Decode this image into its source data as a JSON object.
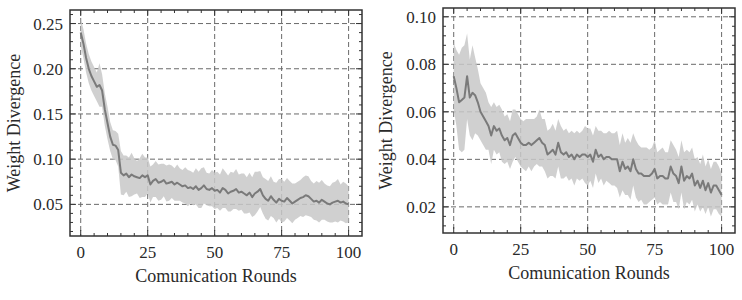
{
  "figure": {
    "background": "#ffffff",
    "line_color": "#7a7a7a",
    "band_color": "#c8c8c8",
    "grid_color": "#6a6a6a",
    "frame_color": "#333333"
  },
  "chart_data": [
    {
      "type": "line",
      "title": "",
      "xlabel": "Comunication Rounds",
      "ylabel": "Weight Divergence",
      "xlim": [
        -4,
        105
      ],
      "ylim": [
        0.015,
        0.265
      ],
      "xticks": [
        0,
        25,
        50,
        75,
        100
      ],
      "xtick_labels": [
        "0",
        "25",
        "50",
        "75",
        "100"
      ],
      "yticks": [
        0.05,
        0.1,
        0.15,
        0.2,
        0.25
      ],
      "ytick_labels": [
        "0.05",
        "0.10",
        "0.15",
        "0.20",
        "0.25"
      ],
      "grid": true,
      "legend": null,
      "series": [
        {
          "name": "mean",
          "shaded_band": "std",
          "x": [
            0,
            1,
            2,
            3,
            4,
            5,
            6,
            7,
            8,
            9,
            10,
            11,
            12,
            13,
            14,
            15,
            16,
            17,
            18,
            19,
            20,
            21,
            22,
            23,
            24,
            25,
            26,
            27,
            28,
            29,
            30,
            31,
            32,
            33,
            34,
            35,
            36,
            37,
            38,
            39,
            40,
            41,
            42,
            43,
            44,
            45,
            46,
            47,
            48,
            49,
            50,
            51,
            52,
            53,
            54,
            55,
            56,
            57,
            58,
            59,
            60,
            61,
            62,
            63,
            64,
            65,
            66,
            67,
            68,
            69,
            70,
            71,
            72,
            73,
            74,
            75,
            76,
            77,
            78,
            79,
            80,
            81,
            82,
            83,
            84,
            85,
            86,
            87,
            88,
            89,
            90,
            91,
            92,
            93,
            94,
            95,
            96,
            97,
            98,
            99,
            100
          ],
          "values": [
            0.24,
            0.228,
            0.212,
            0.2,
            0.192,
            0.186,
            0.18,
            0.182,
            0.176,
            0.155,
            0.14,
            0.125,
            0.116,
            0.115,
            0.11,
            0.085,
            0.082,
            0.084,
            0.08,
            0.083,
            0.081,
            0.08,
            0.079,
            0.082,
            0.08,
            0.082,
            0.072,
            0.076,
            0.078,
            0.074,
            0.075,
            0.077,
            0.073,
            0.074,
            0.075,
            0.072,
            0.074,
            0.072,
            0.07,
            0.071,
            0.068,
            0.069,
            0.067,
            0.07,
            0.066,
            0.068,
            0.071,
            0.067,
            0.066,
            0.068,
            0.065,
            0.066,
            0.063,
            0.068,
            0.066,
            0.062,
            0.064,
            0.065,
            0.067,
            0.063,
            0.064,
            0.062,
            0.06,
            0.063,
            0.058,
            0.062,
            0.064,
            0.067,
            0.06,
            0.056,
            0.054,
            0.059,
            0.055,
            0.052,
            0.056,
            0.054,
            0.053,
            0.057,
            0.054,
            0.051,
            0.053,
            0.055,
            0.057,
            0.058,
            0.06,
            0.059,
            0.056,
            0.053,
            0.054,
            0.052,
            0.055,
            0.053,
            0.051,
            0.05,
            0.052,
            0.053,
            0.054,
            0.052,
            0.053,
            0.051,
            0.05
          ],
          "band_halfwidth": [
            0.015,
            0.016,
            0.016,
            0.016,
            0.016,
            0.016,
            0.016,
            0.024,
            0.018,
            0.018,
            0.018,
            0.016,
            0.016,
            0.016,
            0.018,
            0.024,
            0.022,
            0.02,
            0.022,
            0.024,
            0.02,
            0.018,
            0.022,
            0.024,
            0.022,
            0.02,
            0.02,
            0.018,
            0.02,
            0.02,
            0.02,
            0.018,
            0.02,
            0.02,
            0.018,
            0.018,
            0.02,
            0.018,
            0.018,
            0.02,
            0.02,
            0.018,
            0.018,
            0.02,
            0.02,
            0.022,
            0.02,
            0.018,
            0.018,
            0.02,
            0.02,
            0.02,
            0.02,
            0.022,
            0.02,
            0.02,
            0.022,
            0.02,
            0.022,
            0.02,
            0.02,
            0.022,
            0.02,
            0.022,
            0.022,
            0.024,
            0.022,
            0.02,
            0.02,
            0.022,
            0.022,
            0.022,
            0.02,
            0.022,
            0.022,
            0.024,
            0.022,
            0.022,
            0.022,
            0.022,
            0.02,
            0.02,
            0.02,
            0.022,
            0.022,
            0.022,
            0.02,
            0.02,
            0.022,
            0.022,
            0.022,
            0.02,
            0.02,
            0.02,
            0.022,
            0.022,
            0.024,
            0.02,
            0.022,
            0.022,
            0.02
          ]
        }
      ]
    },
    {
      "type": "line",
      "title": "",
      "xlabel": "Comunication Rounds",
      "ylabel": "Weight Divergence",
      "xlim": [
        -4,
        105
      ],
      "ylim": [
        0.009,
        0.1037
      ],
      "xticks": [
        0,
        25,
        50,
        75,
        100
      ],
      "xtick_labels": [
        "0",
        "25",
        "50",
        "75",
        "100"
      ],
      "yticks": [
        0.02,
        0.04,
        0.06,
        0.08,
        0.1
      ],
      "ytick_labels": [
        "0.02",
        "0.04",
        "0.06",
        "0.08",
        "0.10"
      ],
      "grid": true,
      "legend": null,
      "series": [
        {
          "name": "mean",
          "shaded_band": "std",
          "x": [
            0,
            1,
            2,
            3,
            4,
            5,
            6,
            7,
            8,
            9,
            10,
            11,
            12,
            13,
            14,
            15,
            16,
            17,
            18,
            19,
            20,
            21,
            22,
            23,
            24,
            25,
            26,
            27,
            28,
            29,
            30,
            31,
            32,
            33,
            34,
            35,
            36,
            37,
            38,
            39,
            40,
            41,
            42,
            43,
            44,
            45,
            46,
            47,
            48,
            49,
            50,
            51,
            52,
            53,
            54,
            55,
            56,
            57,
            58,
            59,
            60,
            61,
            62,
            63,
            64,
            65,
            66,
            67,
            68,
            69,
            70,
            71,
            72,
            73,
            74,
            75,
            76,
            77,
            78,
            79,
            80,
            81,
            82,
            83,
            84,
            85,
            86,
            87,
            88,
            89,
            90,
            91,
            92,
            93,
            94,
            95,
            96,
            97,
            98,
            99,
            100
          ],
          "values": [
            0.075,
            0.07,
            0.064,
            0.065,
            0.066,
            0.075,
            0.066,
            0.068,
            0.067,
            0.064,
            0.06,
            0.058,
            0.056,
            0.054,
            0.05,
            0.054,
            0.052,
            0.053,
            0.05,
            0.048,
            0.049,
            0.046,
            0.05,
            0.051,
            0.049,
            0.047,
            0.046,
            0.046,
            0.047,
            0.046,
            0.047,
            0.048,
            0.049,
            0.047,
            0.046,
            0.042,
            0.043,
            0.044,
            0.042,
            0.047,
            0.043,
            0.042,
            0.043,
            0.041,
            0.042,
            0.04,
            0.042,
            0.041,
            0.042,
            0.042,
            0.041,
            0.042,
            0.039,
            0.044,
            0.041,
            0.042,
            0.04,
            0.041,
            0.041,
            0.04,
            0.04,
            0.04,
            0.035,
            0.039,
            0.036,
            0.037,
            0.035,
            0.04,
            0.036,
            0.034,
            0.034,
            0.033,
            0.033,
            0.033,
            0.034,
            0.036,
            0.032,
            0.033,
            0.033,
            0.032,
            0.032,
            0.037,
            0.034,
            0.033,
            0.03,
            0.037,
            0.031,
            0.033,
            0.032,
            0.034,
            0.029,
            0.031,
            0.028,
            0.031,
            0.027,
            0.03,
            0.026,
            0.029,
            0.029,
            0.027,
            0.025
          ],
          "band_halfwidth": [
            0.014,
            0.016,
            0.02,
            0.022,
            0.022,
            0.018,
            0.016,
            0.02,
            0.016,
            0.014,
            0.012,
            0.012,
            0.012,
            0.01,
            0.012,
            0.01,
            0.01,
            0.01,
            0.011,
            0.01,
            0.01,
            0.01,
            0.011,
            0.01,
            0.01,
            0.01,
            0.01,
            0.011,
            0.01,
            0.011,
            0.01,
            0.01,
            0.012,
            0.01,
            0.011,
            0.01,
            0.01,
            0.011,
            0.01,
            0.01,
            0.011,
            0.01,
            0.01,
            0.01,
            0.01,
            0.011,
            0.01,
            0.01,
            0.01,
            0.012,
            0.012,
            0.011,
            0.011,
            0.01,
            0.011,
            0.01,
            0.011,
            0.01,
            0.011,
            0.011,
            0.011,
            0.012,
            0.011,
            0.012,
            0.011,
            0.012,
            0.012,
            0.011,
            0.012,
            0.012,
            0.011,
            0.012,
            0.012,
            0.011,
            0.011,
            0.012,
            0.011,
            0.011,
            0.012,
            0.011,
            0.011,
            0.011,
            0.012,
            0.011,
            0.011,
            0.011,
            0.012,
            0.011,
            0.011,
            0.011,
            0.011,
            0.01,
            0.01,
            0.011,
            0.01,
            0.01,
            0.01,
            0.01,
            0.01,
            0.01,
            0.009
          ]
        }
      ]
    }
  ],
  "layout": {
    "panels": [
      {
        "frame": {
          "x": 70,
          "y": 10,
          "w": 292,
          "h": 226
        }
      },
      {
        "frame": {
          "x": 443,
          "y": 8,
          "w": 292,
          "h": 225
        }
      }
    ]
  }
}
